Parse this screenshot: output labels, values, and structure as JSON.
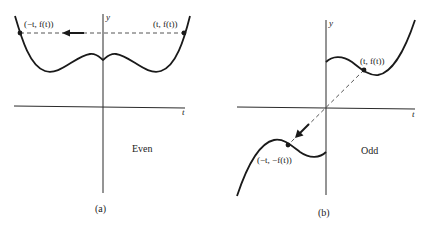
{
  "panels": [
    {
      "id": "a",
      "caption": "(a)",
      "type_label": "Even",
      "y_axis_label": "y",
      "x_axis_label": "t",
      "point_right_label": "(t, f(t))",
      "point_left_label": "(−t, f(t))"
    },
    {
      "id": "b",
      "caption": "(b)",
      "type_label": "Odd",
      "y_axis_label": "y",
      "x_axis_label": "t",
      "point_upper_label": "(t, f(t))",
      "point_lower_label": "(−t, −f(t))"
    }
  ],
  "colors": {
    "ink": "#1a1a1a",
    "dash": "#555555",
    "background": "#ffffff"
  }
}
